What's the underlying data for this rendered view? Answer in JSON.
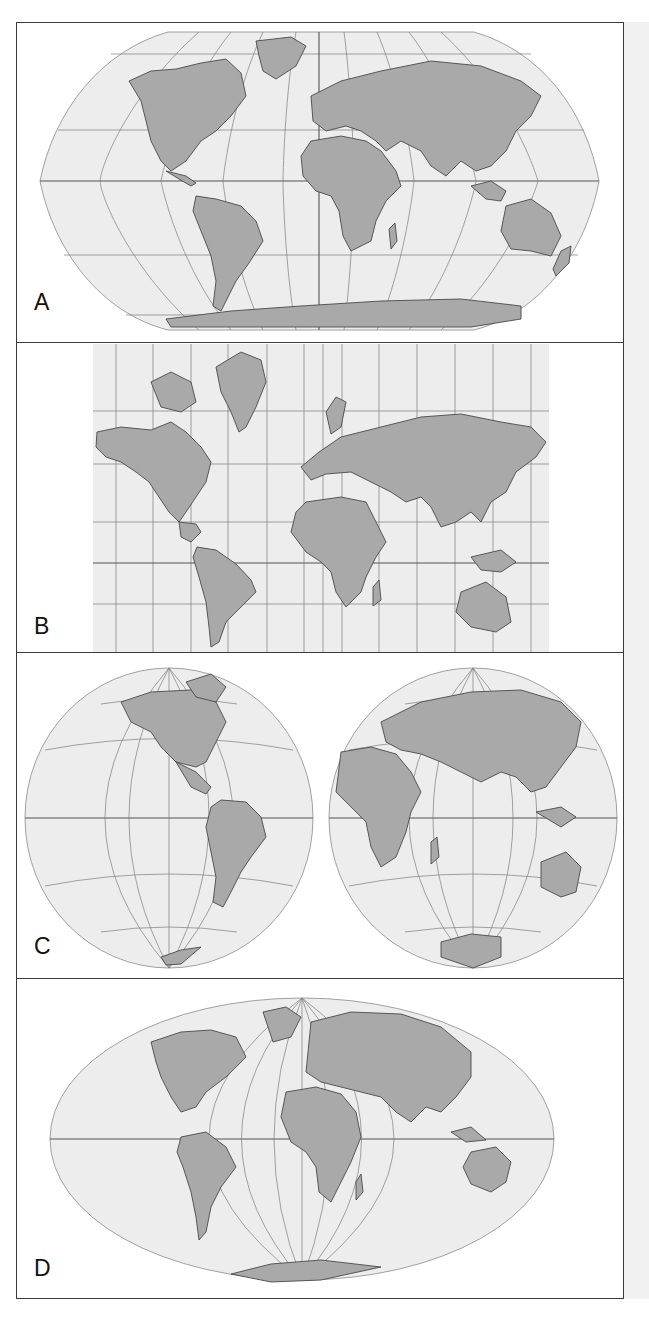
{
  "figure": {
    "panels": [
      {
        "id": "A",
        "label": "A",
        "projection": "Robinson (pseudocylindrical, flat poles)"
      },
      {
        "id": "B",
        "label": "B",
        "projection": "Mercator (cylindrical, rectangular grid)"
      },
      {
        "id": "C",
        "label": "C",
        "projection": "Interrupted hemispheres (Western / Eastern globes)"
      },
      {
        "id": "D",
        "label": "D",
        "projection": "Mollweide-type (elliptical, pointed poles)"
      }
    ]
  },
  "colors": {
    "land": "#a9a9a9",
    "ocean": "#ededed",
    "coastline": "#4a4a4a",
    "graticule": "#7d7d7d",
    "frame": "#3a3a3a",
    "side_strip": "#f1f1f1"
  }
}
